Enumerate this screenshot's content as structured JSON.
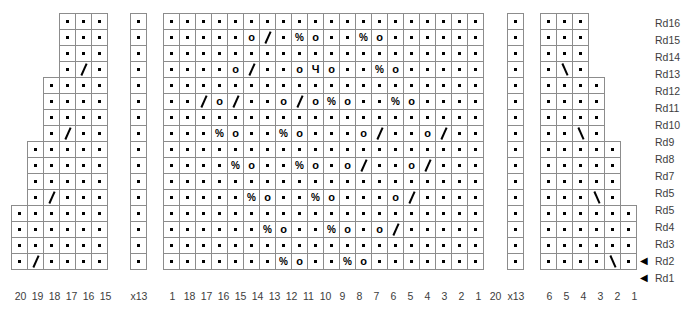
{
  "chart_data": {
    "type": "table",
    "symbol_legend": {
      "dot": "knit stitch",
      "o": "yarn over",
      "slash": "k2tog (right-leaning decrease)",
      "backslash": "ssk (left-leaning decrease)",
      "percent": "centered double decrease",
      "ch": "special stitch"
    },
    "row_labels": [
      {
        "label": "Rd16",
        "arrow": false
      },
      {
        "label": "Rd15",
        "arrow": false
      },
      {
        "label": "Rd14",
        "arrow": false
      },
      {
        "label": "Rd13",
        "arrow": false
      },
      {
        "label": "Rd12",
        "arrow": false
      },
      {
        "label": "Rd11",
        "arrow": false
      },
      {
        "label": "Rd10",
        "arrow": false
      },
      {
        "label": "Rd9",
        "arrow": false
      },
      {
        "label": "Rd8",
        "arrow": false
      },
      {
        "label": "Rd7",
        "arrow": false
      },
      {
        "label": "Rd5",
        "arrow": false
      },
      {
        "label": "Rd5",
        "arrow": false
      },
      {
        "label": "Rd4",
        "arrow": false
      },
      {
        "label": "Rd3",
        "arrow": false
      },
      {
        "label": "Rd2",
        "arrow": true
      },
      {
        "label": "Rd1",
        "arrow": true
      }
    ],
    "left_panel": {
      "name": "left-chart",
      "col_labels": [
        "20",
        "19",
        "18",
        "17",
        "16",
        "15"
      ],
      "repeat_label": "x13",
      "rows": [
        [
          "",
          "",
          "",
          ".",
          ".",
          "."
        ],
        [
          "",
          "",
          "",
          ".",
          ".",
          "."
        ],
        [
          "",
          "",
          "",
          ".",
          ".",
          "."
        ],
        [
          "",
          "",
          "",
          ".",
          "/",
          "."
        ],
        [
          "",
          "",
          ".",
          ".",
          ".",
          "."
        ],
        [
          "",
          "",
          ".",
          ".",
          ".",
          "."
        ],
        [
          "",
          "",
          ".",
          ".",
          ".",
          "."
        ],
        [
          "",
          "",
          ".",
          "/",
          ".",
          "."
        ],
        [
          "",
          ".",
          ".",
          ".",
          ".",
          "."
        ],
        [
          "",
          ".",
          ".",
          ".",
          ".",
          "."
        ],
        [
          "",
          ".",
          ".",
          ".",
          ".",
          "."
        ],
        [
          "",
          ".",
          "/",
          ".",
          ".",
          "."
        ],
        [
          ".",
          ".",
          ".",
          ".",
          ".",
          "."
        ],
        [
          ".",
          ".",
          ".",
          ".",
          ".",
          "."
        ],
        [
          ".",
          ".",
          ".",
          ".",
          ".",
          "."
        ],
        [
          ".",
          "/",
          ".",
          ".",
          ".",
          "."
        ]
      ]
    },
    "left_repeat_panel": {
      "name": "left-repeat-column",
      "repeat_label": "x13",
      "rows": [
        [
          "."
        ],
        [
          "."
        ],
        [
          "."
        ],
        [
          "."
        ],
        [
          "."
        ],
        [
          "."
        ],
        [
          "."
        ],
        [
          "."
        ],
        [
          "."
        ],
        [
          "."
        ],
        [
          "."
        ],
        [
          "."
        ],
        [
          "."
        ],
        [
          "."
        ],
        [
          "."
        ],
        [
          "."
        ]
      ]
    },
    "center_panel": {
      "name": "center-chart",
      "col_labels": [
        "1",
        "18",
        "17",
        "16",
        "15",
        "14",
        "13",
        "12",
        "11",
        "10",
        "9",
        "8",
        "7",
        "6",
        "5",
        "4",
        "3",
        "2",
        "1",
        "20"
      ],
      "rows": [
        [
          ".",
          ".",
          ".",
          ".",
          ".",
          ".",
          ".",
          ".",
          ".",
          ".",
          ".",
          ".",
          ".",
          ".",
          ".",
          ".",
          ".",
          ".",
          ".",
          "."
        ],
        [
          ".",
          ".",
          ".",
          ".",
          ".",
          "o",
          "/",
          ".",
          "%",
          "o",
          ".",
          ".",
          "%",
          "o",
          ".",
          ".",
          ".",
          ".",
          ".",
          "."
        ],
        [
          ".",
          ".",
          ".",
          ".",
          ".",
          ".",
          ".",
          ".",
          ".",
          ".",
          ".",
          ".",
          ".",
          ".",
          ".",
          ".",
          ".",
          ".",
          ".",
          "."
        ],
        [
          ".",
          ".",
          ".",
          ".",
          "o",
          "/",
          ".",
          ".",
          "o",
          "Ч",
          "o",
          ".",
          ".",
          "%",
          "o",
          ".",
          ".",
          ".",
          ".",
          "."
        ],
        [
          ".",
          ".",
          ".",
          ".",
          ".",
          ".",
          ".",
          ".",
          ".",
          ".",
          ".",
          ".",
          ".",
          ".",
          ".",
          ".",
          ".",
          ".",
          ".",
          "."
        ],
        [
          ".",
          ".",
          "/",
          "o",
          "/",
          ".",
          ".",
          "o",
          "/",
          "o",
          "%",
          "o",
          ".",
          ".",
          "%",
          "o",
          ".",
          ".",
          ".",
          "."
        ],
        [
          ".",
          ".",
          ".",
          ".",
          ".",
          ".",
          ".",
          ".",
          ".",
          ".",
          ".",
          ".",
          ".",
          ".",
          ".",
          ".",
          ".",
          ".",
          ".",
          "."
        ],
        [
          ".",
          ".",
          ".",
          "%",
          "o",
          ".",
          ".",
          "%",
          "o",
          ".",
          ".",
          ".",
          "o",
          "/",
          ".",
          ".",
          "o",
          "/",
          ".",
          "."
        ],
        [
          ".",
          ".",
          ".",
          ".",
          ".",
          ".",
          ".",
          ".",
          ".",
          ".",
          ".",
          ".",
          ".",
          ".",
          ".",
          ".",
          ".",
          ".",
          ".",
          "."
        ],
        [
          ".",
          ".",
          ".",
          ".",
          "%",
          "o",
          ".",
          ".",
          "%",
          "o",
          ".",
          "o",
          "/",
          ".",
          ".",
          "o",
          "/",
          ".",
          ".",
          "."
        ],
        [
          ".",
          ".",
          ".",
          ".",
          ".",
          ".",
          ".",
          ".",
          ".",
          ".",
          ".",
          ".",
          ".",
          ".",
          ".",
          ".",
          ".",
          ".",
          ".",
          "."
        ],
        [
          ".",
          ".",
          ".",
          ".",
          ".",
          "%",
          "o",
          ".",
          ".",
          "%",
          "o",
          ".",
          ".",
          ".",
          "o",
          "/",
          ".",
          ".",
          ".",
          "."
        ],
        [
          ".",
          ".",
          ".",
          ".",
          ".",
          ".",
          ".",
          ".",
          ".",
          ".",
          ".",
          ".",
          ".",
          ".",
          ".",
          ".",
          ".",
          ".",
          ".",
          "."
        ],
        [
          ".",
          ".",
          ".",
          ".",
          ".",
          ".",
          "%",
          "o",
          ".",
          ".",
          "%",
          "o",
          ".",
          "o",
          "/",
          ".",
          ".",
          ".",
          ".",
          "."
        ],
        [
          ".",
          ".",
          ".",
          ".",
          ".",
          ".",
          ".",
          ".",
          ".",
          ".",
          ".",
          ".",
          ".",
          ".",
          ".",
          ".",
          ".",
          ".",
          ".",
          "."
        ],
        [
          ".",
          ".",
          ".",
          ".",
          ".",
          ".",
          ".",
          "%",
          "o",
          ".",
          ".",
          "%",
          "o",
          ".",
          ".",
          ".",
          ".",
          ".",
          ".",
          "."
        ]
      ]
    },
    "right_repeat_panel": {
      "name": "right-repeat-column",
      "repeat_label": "x13",
      "rows": [
        [
          "."
        ],
        [
          "."
        ],
        [
          "."
        ],
        [
          "."
        ],
        [
          "."
        ],
        [
          "."
        ],
        [
          "."
        ],
        [
          "."
        ],
        [
          "."
        ],
        [
          "."
        ],
        [
          "."
        ],
        [
          "."
        ],
        [
          "."
        ],
        [
          "."
        ],
        [
          "."
        ],
        [
          "."
        ]
      ]
    },
    "right_panel": {
      "name": "right-chart",
      "col_labels": [
        "6",
        "5",
        "4",
        "3",
        "2",
        "1"
      ],
      "rows": [
        [
          ".",
          ".",
          ".",
          "",
          "",
          ""
        ],
        [
          ".",
          ".",
          ".",
          "",
          "",
          ""
        ],
        [
          ".",
          ".",
          ".",
          "",
          "",
          ""
        ],
        [
          ".",
          "\\",
          ".",
          "",
          "",
          ""
        ],
        [
          ".",
          ".",
          ".",
          ".",
          "",
          ""
        ],
        [
          ".",
          ".",
          ".",
          ".",
          "",
          ""
        ],
        [
          ".",
          ".",
          ".",
          ".",
          "",
          ""
        ],
        [
          ".",
          ".",
          "\\",
          ".",
          "",
          ""
        ],
        [
          ".",
          ".",
          ".",
          ".",
          ".",
          ""
        ],
        [
          ".",
          ".",
          ".",
          ".",
          ".",
          ""
        ],
        [
          ".",
          ".",
          ".",
          ".",
          ".",
          ""
        ],
        [
          ".",
          ".",
          ".",
          "\\",
          ".",
          ""
        ],
        [
          ".",
          ".",
          ".",
          ".",
          ".",
          "."
        ],
        [
          ".",
          ".",
          ".",
          ".",
          ".",
          "."
        ],
        [
          ".",
          ".",
          ".",
          ".",
          ".",
          "."
        ],
        [
          ".",
          ".",
          ".",
          ".",
          "\\",
          "."
        ]
      ]
    }
  }
}
